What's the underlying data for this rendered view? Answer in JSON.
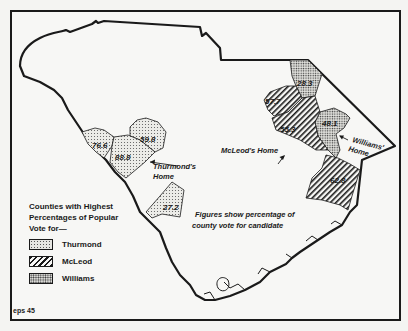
{
  "map": {
    "region": "South Carolina",
    "legend": {
      "title": "Counties with Highest Percentages of Popular Vote for—",
      "items": [
        {
          "candidate": "Thurmond",
          "pattern": "light-stipple"
        },
        {
          "candidate": "McLeod",
          "pattern": "diagonal-hatch"
        },
        {
          "candidate": "Williams",
          "pattern": "dense-stipple"
        }
      ]
    },
    "note": [
      "Figures show percentage of",
      "county vote for candidate"
    ],
    "homes": {
      "thurmond": [
        "Thurmond's",
        "Home"
      ],
      "mcleod": "McLeod's Home",
      "williams": [
        "Williams'",
        "Home"
      ]
    },
    "counties": [
      {
        "candidate": "Thurmond",
        "value": "76.6"
      },
      {
        "candidate": "Thurmond",
        "value": "59.8"
      },
      {
        "candidate": "Thurmond",
        "value": "88.8"
      },
      {
        "candidate": "Thurmond",
        "value": "27.2"
      },
      {
        "candidate": "Williams",
        "value": "28.3"
      },
      {
        "candidate": "McLeod",
        "value": "57.7"
      },
      {
        "candidate": "McLeod",
        "value": "55.3"
      },
      {
        "candidate": "Williams",
        "value": "48.1"
      },
      {
        "candidate": "McLeod",
        "value": "62.8"
      }
    ],
    "figure_id": "eps 45"
  }
}
